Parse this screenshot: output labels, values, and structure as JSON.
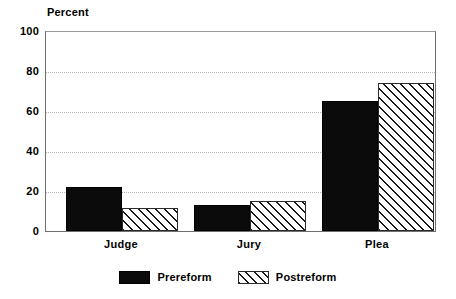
{
  "chart_data": {
    "type": "bar",
    "title": "",
    "subtitle": "",
    "xlabel": "",
    "ylabel": "Percent",
    "categories": [
      "Judge",
      "Jury",
      "Plea"
    ],
    "series": [
      {
        "name": "Prereform",
        "values": [
          22,
          13,
          65
        ],
        "style": "solid-black"
      },
      {
        "name": "Postreform",
        "values": [
          11.5,
          15,
          74
        ],
        "style": "diagonal-hatch"
      }
    ],
    "ylim": [
      0,
      100
    ],
    "yticks": [
      0,
      20,
      40,
      60,
      80,
      100
    ],
    "ytick_labels": [
      "0",
      "20",
      "40",
      "60",
      "80",
      "100"
    ],
    "grid": true,
    "grid_style": "dotted-horizontal",
    "legend_position": "bottom-center"
  },
  "axis": {
    "y_title": "Percent",
    "ticks": [
      {
        "label": "100",
        "value": 100
      },
      {
        "label": "80",
        "value": 80
      },
      {
        "label": "60",
        "value": 60
      },
      {
        "label": "40",
        "value": 40
      },
      {
        "label": "20",
        "value": 20
      },
      {
        "label": "0",
        "value": 0
      }
    ]
  },
  "categories": [
    {
      "label": "Judge"
    },
    {
      "label": "Jury"
    },
    {
      "label": "Plea"
    }
  ],
  "legend": {
    "items": [
      {
        "label": "Prereform",
        "swatch": "solid-black-swatch"
      },
      {
        "label": "Postreform",
        "swatch": "hatched-swatch"
      }
    ]
  },
  "colors": {
    "prereform": "#0b0b0b",
    "postreform_fill": "#ffffff",
    "postreform_hatch": "#1a1a1a",
    "gridline": "#b4b4b4",
    "axis": "#6f6f6f",
    "background": "#ffffff",
    "text": "#000000"
  }
}
